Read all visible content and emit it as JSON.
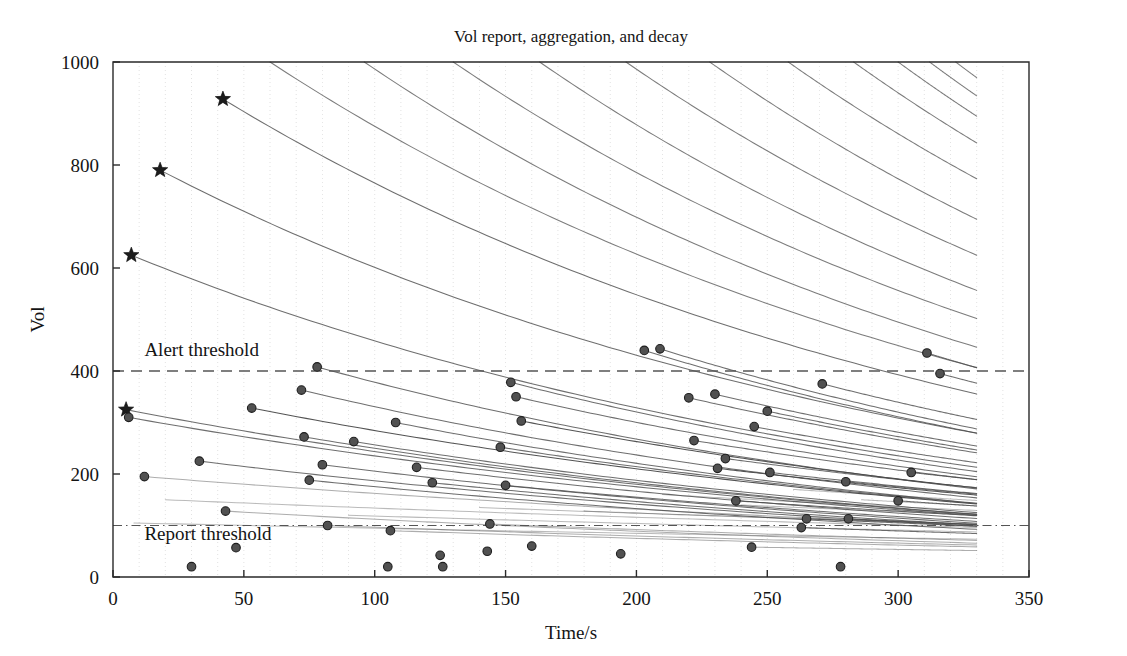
{
  "chart_data": {
    "type": "line",
    "title": "Vol report, aggregation, and decay",
    "xlabel": "Time/s",
    "ylabel": "Vol",
    "xlim": [
      0,
      350
    ],
    "ylim": [
      0,
      1000
    ],
    "xticks": [
      0,
      50,
      100,
      150,
      200,
      250,
      300,
      350
    ],
    "yticks": [
      0,
      200,
      400,
      600,
      800,
      1000
    ],
    "grid": "vertical dotted gridlines every 10 s, faint grey",
    "legend": "none",
    "data_x_extent": [
      0,
      330
    ],
    "annotations": [
      {
        "name": "alert-threshold",
        "label": "Alert threshold",
        "y": 400,
        "label_x": 12,
        "label_y": 430,
        "style": "dashed"
      },
      {
        "name": "report-threshold",
        "label": "Report threshold",
        "y": 100,
        "label_x": 12,
        "label_y": 72,
        "style": "dash-dot"
      }
    ],
    "series_note": "Each series is an exponential decay Vol = V0 * exp(-(t-t0)/tau) starting at its report marker and running to t = 330.",
    "series": [
      {
        "name": "s01",
        "marker": "star",
        "t0": 5,
        "v0": 325,
        "tau": 330,
        "emphasis": "normal"
      },
      {
        "name": "s02",
        "marker": "star",
        "t0": 7,
        "v0": 625,
        "tau": 300,
        "emphasis": "normal"
      },
      {
        "name": "s03",
        "marker": "star",
        "t0": 18,
        "v0": 790,
        "tau": 300,
        "emphasis": "normal"
      },
      {
        "name": "s04",
        "marker": "star",
        "t0": 42,
        "v0": 928,
        "tau": 300,
        "emphasis": "normal"
      },
      {
        "name": "s05",
        "marker": "dot",
        "t0": 6,
        "v0": 310,
        "tau": 340,
        "emphasis": "normal"
      },
      {
        "name": "s06",
        "marker": "dot",
        "t0": 12,
        "v0": 195,
        "tau": 480,
        "emphasis": "faint"
      },
      {
        "name": "s07",
        "marker": "dot",
        "t0": 30,
        "v0": 20,
        "tau": 999,
        "emphasis": "none"
      },
      {
        "name": "s08",
        "marker": "dot",
        "t0": 33,
        "v0": 225,
        "tau": 360,
        "emphasis": "normal"
      },
      {
        "name": "s09",
        "marker": "dot",
        "t0": 43,
        "v0": 128,
        "tau": 430,
        "emphasis": "faint"
      },
      {
        "name": "s10",
        "marker": "dot",
        "t0": 47,
        "v0": 57,
        "tau": 999,
        "emphasis": "none"
      },
      {
        "name": "s11",
        "marker": "dot",
        "t0": 53,
        "v0": 328,
        "tau": 330,
        "emphasis": "bold"
      },
      {
        "name": "s12",
        "marker": "dot",
        "t0": 72,
        "v0": 363,
        "tau": 300,
        "emphasis": "normal"
      },
      {
        "name": "s13",
        "marker": "dot",
        "t0": 73,
        "v0": 272,
        "tau": 320,
        "emphasis": "normal"
      },
      {
        "name": "s14",
        "marker": "dot",
        "t0": 75,
        "v0": 188,
        "tau": 360,
        "emphasis": "normal"
      },
      {
        "name": "s15",
        "marker": "dot",
        "t0": 78,
        "v0": 408,
        "tau": 290,
        "emphasis": "normal"
      },
      {
        "name": "s16",
        "marker": "dot",
        "t0": 80,
        "v0": 218,
        "tau": 340,
        "emphasis": "normal"
      },
      {
        "name": "s17",
        "marker": "dot",
        "t0": 82,
        "v0": 100,
        "tau": 520,
        "emphasis": "faint"
      },
      {
        "name": "s18",
        "marker": "dot",
        "t0": 92,
        "v0": 263,
        "tau": 320,
        "emphasis": "normal"
      },
      {
        "name": "s19",
        "marker": "dot",
        "t0": 105,
        "v0": 20,
        "tau": 999,
        "emphasis": "none"
      },
      {
        "name": "s20",
        "marker": "dot",
        "t0": 106,
        "v0": 90,
        "tau": 520,
        "emphasis": "faint"
      },
      {
        "name": "s21",
        "marker": "dot",
        "t0": 108,
        "v0": 300,
        "tau": 300,
        "emphasis": "normal"
      },
      {
        "name": "s22",
        "marker": "dot",
        "t0": 116,
        "v0": 213,
        "tau": 340,
        "emphasis": "normal"
      },
      {
        "name": "s23",
        "marker": "dot",
        "t0": 122,
        "v0": 183,
        "tau": 350,
        "emphasis": "normal"
      },
      {
        "name": "s24",
        "marker": "dot",
        "t0": 125,
        "v0": 42,
        "tau": 999,
        "emphasis": "none"
      },
      {
        "name": "s25",
        "marker": "dot",
        "t0": 126,
        "v0": 20,
        "tau": 999,
        "emphasis": "none"
      },
      {
        "name": "s26",
        "marker": "dot",
        "t0": 143,
        "v0": 50,
        "tau": 999,
        "emphasis": "none"
      },
      {
        "name": "s27",
        "marker": "dot",
        "t0": 144,
        "v0": 103,
        "tau": 500,
        "emphasis": "faint"
      },
      {
        "name": "s28",
        "marker": "dot",
        "t0": 148,
        "v0": 252,
        "tau": 320,
        "emphasis": "normal"
      },
      {
        "name": "s29",
        "marker": "dot",
        "t0": 150,
        "v0": 178,
        "tau": 360,
        "emphasis": "normal"
      },
      {
        "name": "s30",
        "marker": "dot",
        "t0": 152,
        "v0": 378,
        "tau": 290,
        "emphasis": "normal"
      },
      {
        "name": "s31",
        "marker": "dot",
        "t0": 154,
        "v0": 350,
        "tau": 300,
        "emphasis": "normal"
      },
      {
        "name": "s32",
        "marker": "dot",
        "t0": 156,
        "v0": 303,
        "tau": 310,
        "emphasis": "bold"
      },
      {
        "name": "s33",
        "marker": "dot",
        "t0": 160,
        "v0": 60,
        "tau": 999,
        "emphasis": "none"
      },
      {
        "name": "s34",
        "marker": "dot",
        "t0": 194,
        "v0": 45,
        "tau": 999,
        "emphasis": "none"
      },
      {
        "name": "s35",
        "marker": "dot",
        "t0": 203,
        "v0": 440,
        "tau": 280,
        "emphasis": "normal"
      },
      {
        "name": "s36",
        "marker": "dot",
        "t0": 209,
        "v0": 443,
        "tau": 280,
        "emphasis": "normal"
      },
      {
        "name": "s37",
        "marker": "dot",
        "t0": 220,
        "v0": 348,
        "tau": 300,
        "emphasis": "normal"
      },
      {
        "name": "s38",
        "marker": "dot",
        "t0": 222,
        "v0": 265,
        "tau": 320,
        "emphasis": "normal"
      },
      {
        "name": "s39",
        "marker": "dot",
        "t0": 230,
        "v0": 355,
        "tau": 300,
        "emphasis": "normal"
      },
      {
        "name": "s40",
        "marker": "dot",
        "t0": 231,
        "v0": 211,
        "tau": 350,
        "emphasis": "bold"
      },
      {
        "name": "s41",
        "marker": "dot",
        "t0": 234,
        "v0": 230,
        "tau": 340,
        "emphasis": "normal"
      },
      {
        "name": "s42",
        "marker": "dot",
        "t0": 238,
        "v0": 148,
        "tau": 420,
        "emphasis": "normal"
      },
      {
        "name": "s43",
        "marker": "dot",
        "t0": 244,
        "v0": 58,
        "tau": 700,
        "emphasis": "faint"
      },
      {
        "name": "s44",
        "marker": "dot",
        "t0": 245,
        "v0": 292,
        "tau": 310,
        "emphasis": "normal"
      },
      {
        "name": "s45",
        "marker": "dot",
        "t0": 250,
        "v0": 322,
        "tau": 300,
        "emphasis": "normal"
      },
      {
        "name": "s46",
        "marker": "dot",
        "t0": 251,
        "v0": 203,
        "tau": 350,
        "emphasis": "normal"
      },
      {
        "name": "s47",
        "marker": "dot",
        "t0": 263,
        "v0": 96,
        "tau": 520,
        "emphasis": "normal"
      },
      {
        "name": "s48",
        "marker": "dot",
        "t0": 265,
        "v0": 113,
        "tau": 480,
        "emphasis": "normal"
      },
      {
        "name": "s49",
        "marker": "dot",
        "t0": 271,
        "v0": 375,
        "tau": 290,
        "emphasis": "normal"
      },
      {
        "name": "s50",
        "marker": "dot",
        "t0": 278,
        "v0": 20,
        "tau": 999,
        "emphasis": "none"
      },
      {
        "name": "s51",
        "marker": "dot",
        "t0": 280,
        "v0": 185,
        "tau": 360,
        "emphasis": "normal"
      },
      {
        "name": "s52",
        "marker": "dot",
        "t0": 281,
        "v0": 113,
        "tau": 470,
        "emphasis": "normal"
      },
      {
        "name": "s53",
        "marker": "dot",
        "t0": 300,
        "v0": 148,
        "tau": 420,
        "emphasis": "normal"
      },
      {
        "name": "s54",
        "marker": "dot",
        "t0": 305,
        "v0": 203,
        "tau": 350,
        "emphasis": "normal"
      },
      {
        "name": "s55",
        "marker": "dot",
        "t0": 311,
        "v0": 435,
        "tau": 280,
        "emphasis": "normal"
      },
      {
        "name": "s56",
        "marker": "dot",
        "t0": 316,
        "v0": 395,
        "tau": 290,
        "emphasis": "normal"
      }
    ],
    "top_entry_curves": [
      {
        "name": "e01",
        "t0": 60,
        "v0": 1000,
        "tau": 300
      },
      {
        "name": "e02",
        "t0": 96,
        "v0": 1000,
        "tau": 290
      },
      {
        "name": "e03",
        "t0": 130,
        "v0": 1000,
        "tau": 290
      },
      {
        "name": "e04",
        "t0": 163,
        "v0": 1000,
        "tau": 285
      },
      {
        "name": "e05",
        "t0": 196,
        "v0": 1000,
        "tau": 285
      },
      {
        "name": "e06",
        "t0": 228,
        "v0": 1000,
        "tau": 280
      },
      {
        "name": "e07",
        "t0": 258,
        "v0": 1000,
        "tau": 280
      },
      {
        "name": "e08",
        "t0": 283,
        "v0": 1000,
        "tau": 275
      },
      {
        "name": "e09",
        "t0": 300,
        "v0": 1000,
        "tau": 270
      },
      {
        "name": "e10",
        "t0": 312,
        "v0": 1000,
        "tau": 265
      },
      {
        "name": "e11",
        "t0": 322,
        "v0": 1000,
        "tau": 260
      }
    ],
    "extra_low_curves": [
      {
        "name": "x01",
        "t0": 8,
        "v0": 105,
        "tau": 900
      },
      {
        "name": "x02",
        "t0": 20,
        "v0": 150,
        "tau": 700
      },
      {
        "name": "x03",
        "t0": 90,
        "v0": 120,
        "tau": 760
      },
      {
        "name": "x04",
        "t0": 140,
        "v0": 135,
        "tau": 700
      },
      {
        "name": "x05",
        "t0": 180,
        "v0": 128,
        "tau": 680
      },
      {
        "name": "x06",
        "t0": 210,
        "v0": 160,
        "tau": 560
      },
      {
        "name": "x07",
        "t0": 240,
        "v0": 140,
        "tau": 600
      },
      {
        "name": "x08",
        "t0": 260,
        "v0": 170,
        "tau": 520
      },
      {
        "name": "x09",
        "t0": 286,
        "v0": 150,
        "tau": 540
      },
      {
        "name": "x10",
        "t0": 296,
        "v0": 130,
        "tau": 560
      }
    ],
    "colors": {
      "curve": "#4a4a4a",
      "marker_fill": "#515151",
      "marker_edge": "#1f1f1f",
      "threshold": "#555555",
      "axis": "#2a2a2a",
      "grid": "#c9c9c9",
      "background": "#ffffff"
    }
  }
}
